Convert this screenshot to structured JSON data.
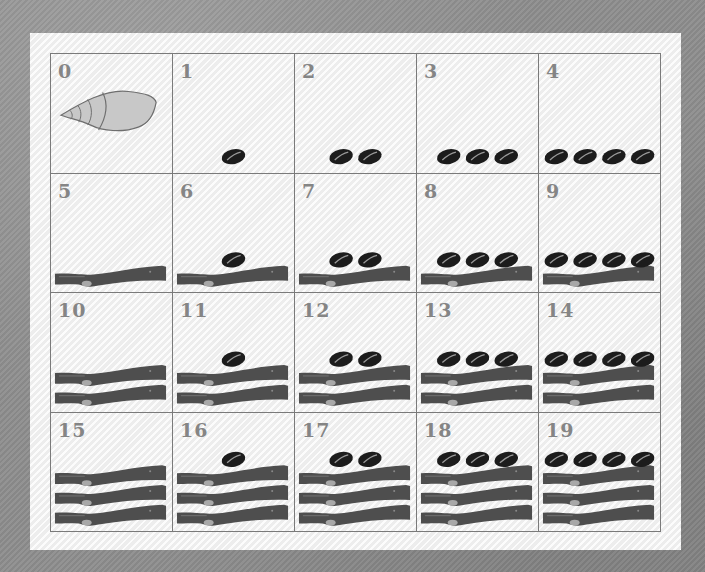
{
  "colors": {
    "background": "#8d8d8d",
    "panel": "#f4f4f4",
    "grid_line": "#7a7a7a",
    "number_text": "#858585",
    "cowrie": "#1c1c1c",
    "cowrie_stripe": "#9a9a9a",
    "stick": "#4e4e4e",
    "stick_knot": "#a8a8a8",
    "shell_fill": "#c8c8c8",
    "shell_stroke": "#6e6e6e"
  },
  "cells": [
    {
      "label": "0",
      "symbol": "shell",
      "bars": 0,
      "dots": 0
    },
    {
      "label": "1",
      "symbol": "dots-bars",
      "bars": 0,
      "dots": 1
    },
    {
      "label": "2",
      "symbol": "dots-bars",
      "bars": 0,
      "dots": 2
    },
    {
      "label": "3",
      "symbol": "dots-bars",
      "bars": 0,
      "dots": 3
    },
    {
      "label": "4",
      "symbol": "dots-bars",
      "bars": 0,
      "dots": 4
    },
    {
      "label": "5",
      "symbol": "dots-bars",
      "bars": 1,
      "dots": 0
    },
    {
      "label": "6",
      "symbol": "dots-bars",
      "bars": 1,
      "dots": 1
    },
    {
      "label": "7",
      "symbol": "dots-bars",
      "bars": 1,
      "dots": 2
    },
    {
      "label": "8",
      "symbol": "dots-bars",
      "bars": 1,
      "dots": 3
    },
    {
      "label": "9",
      "symbol": "dots-bars",
      "bars": 1,
      "dots": 4
    },
    {
      "label": "10",
      "symbol": "dots-bars",
      "bars": 2,
      "dots": 0
    },
    {
      "label": "11",
      "symbol": "dots-bars",
      "bars": 2,
      "dots": 1
    },
    {
      "label": "12",
      "symbol": "dots-bars",
      "bars": 2,
      "dots": 2
    },
    {
      "label": "13",
      "symbol": "dots-bars",
      "bars": 2,
      "dots": 3
    },
    {
      "label": "14",
      "symbol": "dots-bars",
      "bars": 2,
      "dots": 4
    },
    {
      "label": "15",
      "symbol": "dots-bars",
      "bars": 3,
      "dots": 0
    },
    {
      "label": "16",
      "symbol": "dots-bars",
      "bars": 3,
      "dots": 1
    },
    {
      "label": "17",
      "symbol": "dots-bars",
      "bars": 3,
      "dots": 2
    },
    {
      "label": "18",
      "symbol": "dots-bars",
      "bars": 3,
      "dots": 3
    },
    {
      "label": "19",
      "symbol": "dots-bars",
      "bars": 3,
      "dots": 4
    }
  ]
}
